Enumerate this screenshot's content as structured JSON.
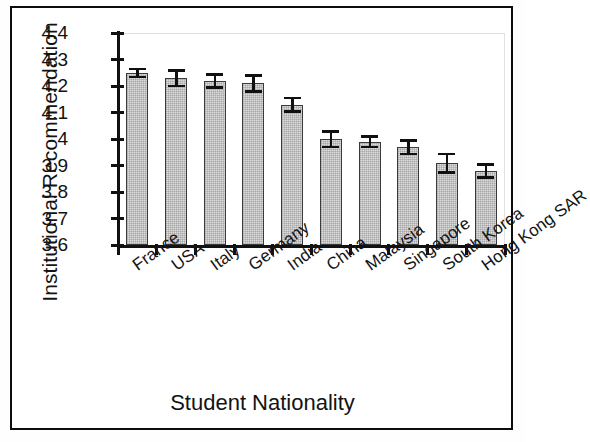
{
  "chart_data": {
    "type": "bar",
    "title": "",
    "xlabel": "Student Nationality",
    "ylabel": "Institutional Recommendation",
    "ylim": [
      3.6,
      4.4
    ],
    "ytick_labels": [
      "4.4",
      "4.3",
      "4.2",
      "4.1",
      "4",
      "3.9",
      "3.8",
      "3.7",
      "3.6"
    ],
    "ytick_values": [
      4.4,
      4.3,
      4.2,
      4.1,
      4.0,
      3.9,
      3.8,
      3.7,
      3.6
    ],
    "grid": false,
    "legend": null,
    "error_bars": "yes",
    "categories": [
      "France",
      "USA",
      "Italy",
      "Germany",
      "India",
      "China",
      "Malaysia",
      "Singapore",
      "South Korea",
      "Hong Kong SAR"
    ],
    "values": [
      4.25,
      4.23,
      4.22,
      4.21,
      4.13,
      4.0,
      3.99,
      3.97,
      3.91,
      3.88
    ],
    "err_low": [
      0.015,
      0.03,
      0.025,
      0.03,
      0.025,
      0.03,
      0.02,
      0.025,
      0.035,
      0.025
    ],
    "err_high": [
      0.015,
      0.03,
      0.025,
      0.03,
      0.025,
      0.03,
      0.02,
      0.025,
      0.035,
      0.025
    ],
    "bar_color": "#dcdcdc",
    "bar_edge_color": "#3a3a3a",
    "axis_color": "#111111",
    "series": [
      {
        "name": "Institutional Recommendation",
        "values": [
          4.25,
          4.23,
          4.22,
          4.21,
          4.13,
          4.0,
          3.99,
          3.97,
          3.91,
          3.88
        ]
      }
    ]
  }
}
